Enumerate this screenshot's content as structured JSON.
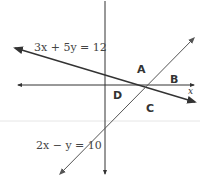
{
  "diagram": {
    "type": "coordinate-plane-system-of-equations",
    "axes": {
      "x_label": "x",
      "y_label": "y"
    },
    "lines": [
      {
        "id": "line1",
        "equation": "3x + 5y = 12",
        "color": "#333333"
      },
      {
        "id": "line2",
        "equation": "2x − y = 10",
        "color": "#555555"
      }
    ],
    "regions": [
      {
        "id": "A",
        "label": "A"
      },
      {
        "id": "B",
        "label": "B"
      },
      {
        "id": "C",
        "label": "C"
      },
      {
        "id": "D",
        "label": "D"
      }
    ],
    "colors": {
      "axis": "#333333",
      "background": "#ffffff",
      "separator": "#e6e6e6"
    }
  }
}
